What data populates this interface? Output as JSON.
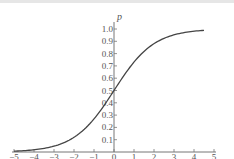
{
  "chart_data": {
    "type": "line",
    "title": "",
    "xlabel": "",
    "ylabel": "p",
    "xlim": [
      -5,
      5
    ],
    "ylim": [
      0,
      1.0
    ],
    "grid": false,
    "legend": null,
    "x_ticks": [
      -5,
      -4,
      -3,
      -2,
      -1,
      0,
      1,
      2,
      3,
      4,
      5
    ],
    "x_tick_labels": [
      "−5",
      "−4",
      "−3",
      "−2",
      "−1",
      "0",
      "1",
      "2",
      "3",
      "4",
      "5"
    ],
    "y_ticks": [
      0.1,
      0.2,
      0.3,
      0.4,
      0.5,
      0.6,
      0.7,
      0.8,
      0.9,
      1.0
    ],
    "y_tick_labels": [
      "0.1",
      "0.2",
      "0.3",
      "0.4",
      "0.5",
      "0.6",
      "0.7",
      "0.8",
      "0.9",
      "1.0"
    ],
    "series": [
      {
        "name": "sigmoid",
        "x": [
          -5,
          -4,
          -3,
          -2,
          -1,
          0,
          1,
          2,
          3,
          4,
          4.5
        ],
        "values": [
          0.007,
          0.018,
          0.047,
          0.119,
          0.269,
          0.5,
          0.731,
          0.881,
          0.953,
          0.982,
          0.989
        ]
      }
    ],
    "colors": {
      "line": "#444444",
      "axis": "#777777",
      "text": "#555555"
    }
  }
}
